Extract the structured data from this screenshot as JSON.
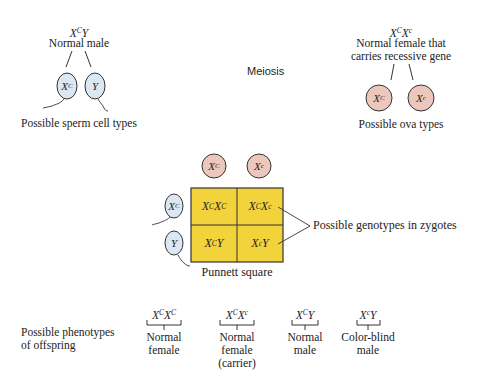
{
  "colors": {
    "sperm_fill": "#dbe8f3",
    "ova_fill": "#ecc8bc",
    "punnett_fill": "#f2d33c",
    "line": "#333333"
  },
  "father": {
    "genotype": {
      "base1": "X",
      "sup1": "C",
      "base2": "Y",
      "sup2": ""
    },
    "label": "Normal male",
    "gametes": [
      {
        "base": "X",
        "sup": "C",
        "icon": "sperm-cell-icon"
      },
      {
        "base": "Y",
        "sup": "",
        "icon": "sperm-cell-icon"
      }
    ],
    "caption": "Possible sperm cell types"
  },
  "process_label": "Meiosis",
  "mother": {
    "genotype": {
      "base1": "X",
      "sup1": "C",
      "base2": "X",
      "sup2": "c"
    },
    "label_line1": "Normal female that",
    "label_line2": "carries recessive gene",
    "gametes": [
      {
        "base": "X",
        "sup": "C",
        "icon": "ovum-cell-icon"
      },
      {
        "base": "X",
        "sup": "c",
        "icon": "ovum-cell-icon"
      }
    ],
    "caption": "Possible ova types"
  },
  "punnett": {
    "title": "Punnett square",
    "top_headers": [
      {
        "base": "X",
        "sup": "C"
      },
      {
        "base": "X",
        "sup": "c"
      }
    ],
    "side_headers": [
      {
        "base": "X",
        "sup": "C"
      },
      {
        "base": "Y",
        "sup": ""
      }
    ],
    "cells": [
      [
        {
          "b1": "X",
          "s1": "C",
          "b2": "X",
          "s2": "C"
        },
        {
          "b1": "X",
          "s1": "C",
          "b2": "X",
          "s2": "c"
        }
      ],
      [
        {
          "b1": "X",
          "s1": "C",
          "b2": "Y",
          "s2": ""
        },
        {
          "b1": "X",
          "s1": "c",
          "b2": "Y",
          "s2": ""
        }
      ]
    ],
    "callout": "Possible genotypes in zygotes"
  },
  "phenotypes": {
    "heading_line1": "Possible phenotypes",
    "heading_line2": "of offspring",
    "items": [
      {
        "b1": "X",
        "s1": "C",
        "b2": "X",
        "s2": "C",
        "line1": "Normal",
        "line2": "female",
        "line3": ""
      },
      {
        "b1": "X",
        "s1": "C",
        "b2": "X",
        "s2": "c",
        "line1": "Normal",
        "line2": "female",
        "line3": "(carrier)"
      },
      {
        "b1": "X",
        "s1": "C",
        "b2": "Y",
        "s2": "",
        "line1": "Normal",
        "line2": "male",
        "line3": ""
      },
      {
        "b1": "X",
        "s1": "c",
        "b2": "Y",
        "s2": "",
        "line1": "Color-blind",
        "line2": "male",
        "line3": ""
      }
    ]
  }
}
